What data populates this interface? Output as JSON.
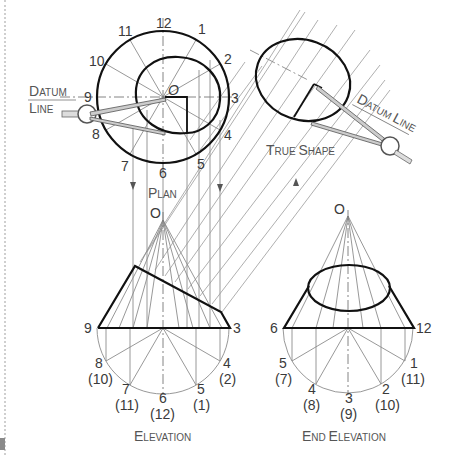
{
  "plan": {
    "title_first": "P",
    "title_rest": "LAN",
    "apex_label": "O",
    "numbers": [
      "12",
      "1",
      "2",
      "3",
      "4",
      "5",
      "6",
      "7",
      "8",
      "9",
      "10",
      "11"
    ],
    "datum": {
      "first1": "D",
      "rest1": "ATUM",
      "first2": "L",
      "rest2": "INE"
    }
  },
  "true_shape": {
    "title": {
      "first1": "T",
      "rest1": "RUE ",
      "first2": "S",
      "rest2": "HAPE"
    },
    "datum": {
      "first1": "D",
      "rest1": "ATUM ",
      "first2": "L",
      "rest2": "INE"
    }
  },
  "elevation": {
    "title": {
      "first": "E",
      "rest": "LEVATION"
    },
    "apex_label": "O",
    "left_label": "9",
    "right_label": "3",
    "points": [
      {
        "top": "8",
        "bottom": "(10)"
      },
      {
        "top": "7",
        "bottom": "(11)"
      },
      {
        "top": "6",
        "bottom": "(12)"
      },
      {
        "top": "5",
        "bottom": "(1)"
      },
      {
        "top": "4",
        "bottom": "(2)"
      }
    ]
  },
  "end_elevation": {
    "title": {
      "first1": "E",
      "rest1": "ND ",
      "first2": "E",
      "rest2": "LEVATION"
    },
    "apex_label": "O",
    "left_label": "6",
    "right_label": "12",
    "points": [
      {
        "top": "5",
        "bottom": "(7)"
      },
      {
        "top": "4",
        "bottom": "(8)"
      },
      {
        "top": "3",
        "bottom": "(9)"
      },
      {
        "top": "2",
        "bottom": "(10)"
      },
      {
        "top": "1",
        "bottom": "(11)"
      }
    ]
  }
}
